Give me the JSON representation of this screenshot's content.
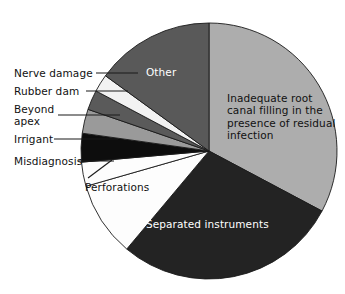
{
  "chart_data": {
    "type": "pie",
    "title": "",
    "subtitle": "",
    "xlabel": "",
    "ylabel": "",
    "legend_position": "none",
    "grid": false,
    "start_angle_deg": 0,
    "direction": "clockwise",
    "center": {
      "x": 209,
      "y": 151
    },
    "radius": 128,
    "categories": [
      "Inadequate root canal filling in the presence of residual infection",
      "Separated instruments",
      "Perforations",
      "Misdiagnosis",
      "Irrigant",
      "Beyond apex",
      "Rubber dam",
      "Nerve damage",
      "Other"
    ],
    "values": [
      32.8,
      28.3,
      9.4,
      3.1,
      3.6,
      3.1,
      2.5,
      2.2,
      15.0
    ],
    "angles_deg": [
      118,
      102,
      34,
      11,
      13,
      11,
      9,
      8,
      54
    ],
    "colors": [
      "#adadad",
      "#232323",
      "#fdfdfd",
      "#fdfdfd",
      "#0d0d0d",
      "#9a9a9a",
      "#5a5a5a",
      "#f2f2f2",
      "#595959"
    ],
    "slices": [
      {
        "label": "Inadequate root canal filling in the presence of residual infection",
        "value": 32.8,
        "angle_deg": 118,
        "color": "#adadad",
        "label_placement": "inside",
        "label_color": "#111111"
      },
      {
        "label": "Separated instruments",
        "value": 28.3,
        "angle_deg": 102,
        "color": "#232323",
        "label_placement": "inside",
        "label_color": "#ffffff"
      },
      {
        "label": "Perforations",
        "value": 9.4,
        "angle_deg": 34,
        "color": "#fdfdfd",
        "label_placement": "leader",
        "label_color": "#111111"
      },
      {
        "label": "Misdiagnosis",
        "value": 3.1,
        "angle_deg": 11,
        "color": "#fdfdfd",
        "label_placement": "leader",
        "label_color": "#111111"
      },
      {
        "label": "Irrigant",
        "value": 3.6,
        "angle_deg": 13,
        "color": "#0d0d0d",
        "label_placement": "leader",
        "label_color": "#111111"
      },
      {
        "label": "Beyond apex",
        "value": 3.1,
        "angle_deg": 11,
        "color": "#9a9a9a",
        "label_placement": "leader",
        "label_color": "#111111"
      },
      {
        "label": "Rubber dam",
        "value": 2.5,
        "angle_deg": 9,
        "color": "#5a5a5a",
        "label_placement": "leader",
        "label_color": "#111111"
      },
      {
        "label": "Nerve damage",
        "value": 2.2,
        "angle_deg": 8,
        "color": "#f2f2f2",
        "label_placement": "leader",
        "label_color": "#111111"
      },
      {
        "label": "Other",
        "value": 15.0,
        "angle_deg": 54,
        "color": "#595959",
        "label_placement": "inside",
        "label_color": "#ffffff"
      }
    ]
  },
  "labels": {
    "nerve_damage": "Nerve damage",
    "rubber_dam": "Rubber dam",
    "beyond_apex": "Beyond\napex",
    "irrigant": "Irrigant",
    "misdiagnosis": "Misdiagnosis",
    "perforations": "Perforations",
    "other": "Other",
    "inadequate": "Inadequate root\ncanal filling in the\npresence of residual\ninfection",
    "separated": "Separated instruments"
  },
  "colors": {
    "background": "#ffffff",
    "outline": "#1a1a1a",
    "text": "#111111",
    "text_inverse": "#ffffff"
  }
}
